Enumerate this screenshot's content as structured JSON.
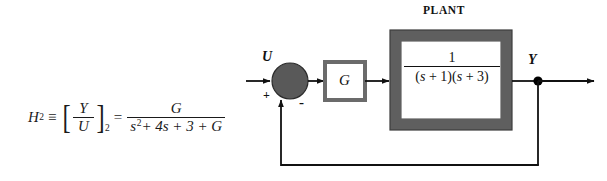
{
  "figure": {
    "type": "control-system-block-diagram"
  },
  "equation": {
    "lhs_symbol": "H",
    "lhs_subscript": "2",
    "identity_op": "≡",
    "ratio_numerator": "Y",
    "ratio_denominator": "U",
    "ratio_subscript": "2",
    "equals_op": "=",
    "rhs_numerator": "G",
    "rhs_denominator_plain": "s² + 4s + 3 + G",
    "rhs_den_s": "s",
    "rhs_den_exp": "2",
    "rhs_den_rest": "+ 4s + 3 + G",
    "full_text": "H₂ ≡ [Y/U]₂ = G / (s² + 4s + 3 + G)"
  },
  "diagram": {
    "plant_label": "PLANT",
    "input_label": "U",
    "output_label": "Y",
    "sum_plus_sign": "+",
    "sum_minus_sign": "-",
    "controller_label": "G",
    "plant_tf_numerator": "1",
    "plant_tf_denominator": "(s + 1)(s + 3)",
    "plant_tf_den_parts": {
      "open1": "(",
      "s1": "s",
      "plus1": " + 1",
      "close1": ")",
      "open2": "(",
      "s2": "s",
      "plus2": " + 3",
      "close2": ")"
    }
  },
  "colors": {
    "line": "#111111",
    "block_border_gray": "#6b6b6b",
    "plant_border_gray": "#5f5f5f",
    "sum_fill_gray": "#595959",
    "text": "#111111",
    "background": "#ffffff",
    "node_dot": "#000000"
  },
  "geometry": {
    "canvas_width": 607,
    "canvas_height": 181,
    "sum_center_x": 290,
    "sum_center_y": 81,
    "sum_radius": 18,
    "signal_line_y": 81,
    "feedback_line_y": 165,
    "output_node_x": 538,
    "g_block": {
      "x": 325,
      "y": 62,
      "w": 40,
      "h": 38
    },
    "plant_block": {
      "x": 390,
      "y": 30,
      "w": 122,
      "h": 100
    }
  }
}
